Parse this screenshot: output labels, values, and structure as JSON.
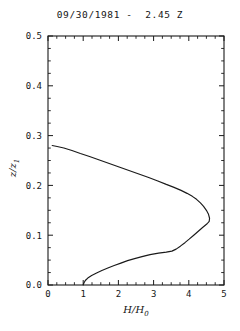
{
  "chart_data": {
    "type": "line",
    "title": "09/30/1981 -  2.45 Z",
    "xlabel": "H/H0",
    "xlabel_main": "H/H",
    "xlabel_sub": "0",
    "ylabel": "z/z1",
    "ylabel_main": "z/z",
    "ylabel_sub": "1",
    "xlim": [
      0,
      5
    ],
    "ylim": [
      0.0,
      0.5
    ],
    "xticks": [
      0,
      1,
      2,
      3,
      4,
      5
    ],
    "xtick_labels": [
      "0",
      "1",
      "2",
      "3",
      "4",
      "5"
    ],
    "yticks": [
      0.0,
      0.1,
      0.2,
      0.3,
      0.4,
      0.5
    ],
    "ytick_labels": [
      "0.0",
      "0.1",
      "0.2",
      "0.3",
      "0.4",
      "0.5"
    ],
    "x_minor_interval": 0.25,
    "y_minor_interval": 0.025,
    "grid": false,
    "legend": null,
    "series": [
      {
        "name": "H/H0 profile",
        "color": "#1a1a1a",
        "points": [
          [
            1.0,
            0.0
          ],
          [
            1.02,
            0.004
          ],
          [
            1.06,
            0.009
          ],
          [
            1.13,
            0.014
          ],
          [
            1.24,
            0.019
          ],
          [
            1.38,
            0.024
          ],
          [
            1.53,
            0.029
          ],
          [
            1.7,
            0.034
          ],
          [
            1.88,
            0.039
          ],
          [
            2.07,
            0.044
          ],
          [
            2.26,
            0.049
          ],
          [
            2.46,
            0.053
          ],
          [
            2.67,
            0.057
          ],
          [
            2.9,
            0.061
          ],
          [
            3.14,
            0.064
          ],
          [
            3.36,
            0.066
          ],
          [
            3.52,
            0.068
          ],
          [
            3.64,
            0.072
          ],
          [
            3.76,
            0.078
          ],
          [
            3.89,
            0.085
          ],
          [
            4.01,
            0.092
          ],
          [
            4.14,
            0.1
          ],
          [
            4.27,
            0.108
          ],
          [
            4.4,
            0.116
          ],
          [
            4.52,
            0.123
          ],
          [
            4.58,
            0.128
          ],
          [
            4.59,
            0.134
          ],
          [
            4.56,
            0.142
          ],
          [
            4.5,
            0.15
          ],
          [
            4.42,
            0.158
          ],
          [
            4.33,
            0.165
          ],
          [
            4.22,
            0.172
          ],
          [
            4.1,
            0.178
          ],
          [
            3.95,
            0.184
          ],
          [
            3.78,
            0.19
          ],
          [
            3.58,
            0.196
          ],
          [
            3.36,
            0.202
          ],
          [
            3.12,
            0.209
          ],
          [
            2.86,
            0.216
          ],
          [
            2.58,
            0.223
          ],
          [
            2.3,
            0.23
          ],
          [
            2.02,
            0.237
          ],
          [
            1.74,
            0.244
          ],
          [
            1.46,
            0.251
          ],
          [
            1.18,
            0.258
          ],
          [
            0.92,
            0.264
          ],
          [
            0.68,
            0.27
          ],
          [
            0.45,
            0.275
          ],
          [
            0.26,
            0.278
          ],
          [
            0.12,
            0.28
          ]
        ],
        "notes": {
          "start_point": [
            1.0,
            0.0
          ],
          "peak_point": [
            4.59,
            0.128
          ],
          "end_point": [
            0.12,
            0.28
          ]
        }
      }
    ]
  }
}
